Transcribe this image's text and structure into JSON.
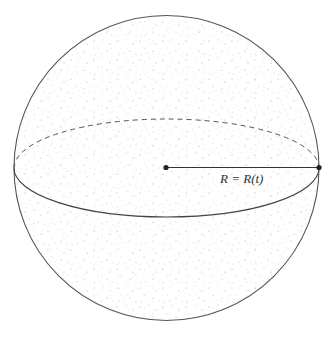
{
  "diagram": {
    "radius_label": "R = R(t)",
    "colors": {
      "outline": "#555555",
      "dots": "#9a9a9a",
      "background": "#ffffff",
      "point": "#222222"
    }
  }
}
